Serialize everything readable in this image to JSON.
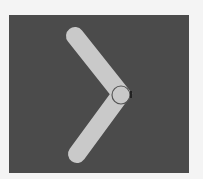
{
  "icon": {
    "name": "chevron-right-icon",
    "colors": {
      "page_background": "#f4f4f4",
      "panel_background": "#4b4b4b",
      "stroke": "#c9c9c9",
      "vertex_outline": "#555555"
    }
  }
}
